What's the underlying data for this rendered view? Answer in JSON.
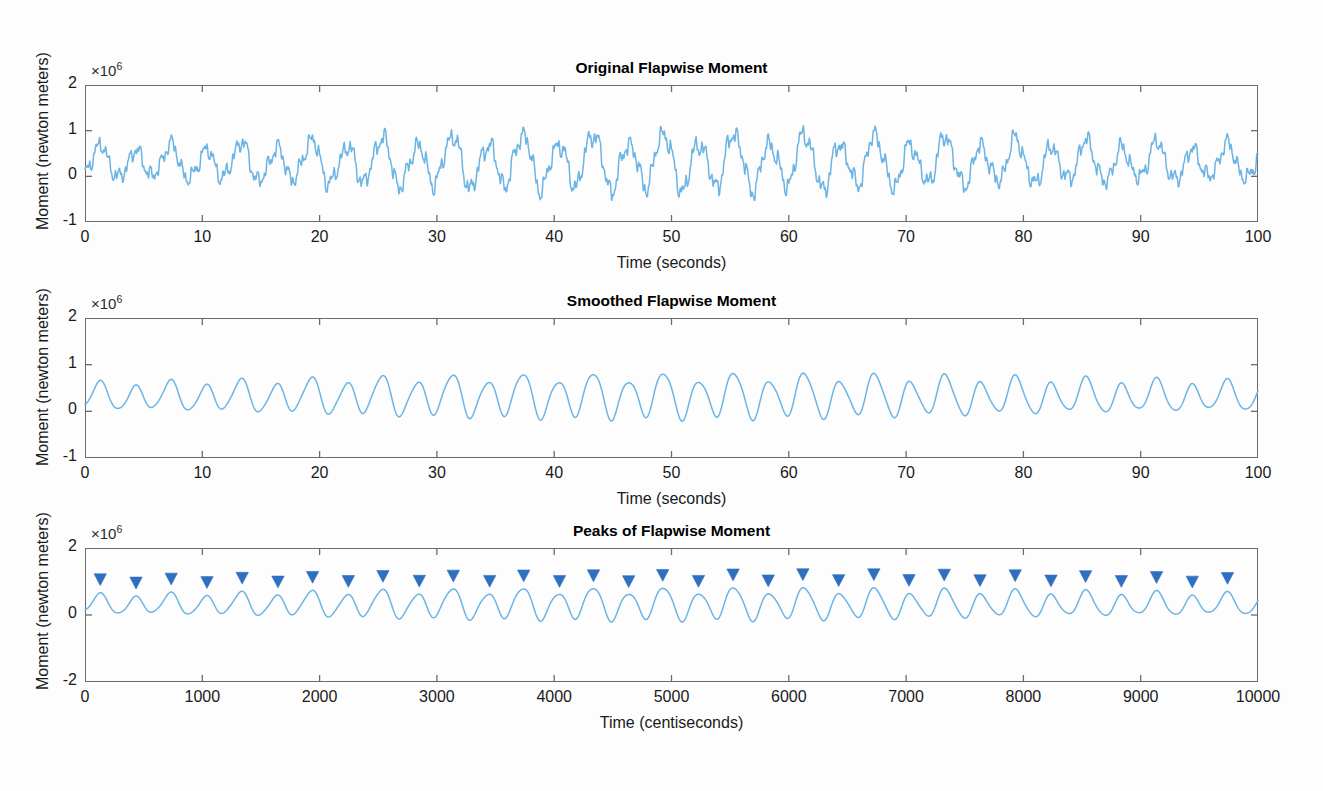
{
  "figure": {
    "background_color": "#fdfdfd",
    "axis_color": "#6b6b6b",
    "line_color": "#6cb4e4",
    "marker_color": "#2f6fc0",
    "width": 1323,
    "height": 791
  },
  "chart_data": [
    {
      "type": "line",
      "title": "Original Flapwise Moment",
      "xlabel": "Time (seconds)",
      "ylabel": "Moment (newton meters)",
      "exponent_label": "×10",
      "exponent_value": "6",
      "xlim": [
        0,
        100
      ],
      "ylim": [
        -1000000,
        2000000
      ],
      "xticks": [
        0,
        10,
        20,
        30,
        40,
        50,
        60,
        70,
        80,
        90,
        100
      ],
      "xticklabels": [
        "0",
        "10",
        "20",
        "30",
        "40",
        "50",
        "60",
        "70",
        "80",
        "90",
        "100"
      ],
      "yticks": [
        -1000000,
        0,
        1000000,
        2000000
      ],
      "yticklabels": [
        "-1",
        "0",
        "1",
        "2"
      ],
      "grid": false,
      "legend": "none",
      "series_name": "original flapwise moment",
      "description": "Noisy oscillating rotor blade flapwise bending moment, base frequency about 0.33 Hz with high frequency noise, mean near 3e5 N·m, peaks rising from about 6e5 early to about 1.2e6 near t=53 s, minima dipping to about -4e5 near t=59 s",
      "signal_model": {
        "mean": 300000,
        "base_amplitude": 260000,
        "base_frequency_hz": 0.333,
        "amplitude_envelope_peak_time_s": 50,
        "amplitude_envelope_gain": 2.1,
        "noise_amplitude": 150000,
        "noise_frequencies_hz": [
          1.1,
          2.3,
          3.7,
          5.9
        ],
        "samples": 2000
      }
    },
    {
      "type": "line",
      "title": "Smoothed Flapwise Moment",
      "xlabel": "Time (seconds)",
      "ylabel": "Moment (newton meters)",
      "exponent_label": "×10",
      "exponent_value": "6",
      "xlim": [
        0,
        100
      ],
      "ylim": [
        -1000000,
        2000000
      ],
      "xticks": [
        0,
        10,
        20,
        30,
        40,
        50,
        60,
        70,
        80,
        90,
        100
      ],
      "xticklabels": [
        "0",
        "10",
        "20",
        "30",
        "40",
        "50",
        "60",
        "70",
        "80",
        "90",
        "100"
      ],
      "yticks": [
        -1000000,
        0,
        1000000,
        2000000
      ],
      "yticklabels": [
        "-1",
        "0",
        "1",
        "2"
      ],
      "grid": false,
      "legend": "none",
      "series_name": "smoothed flapwise moment",
      "description": "Low-pass filtered version of the original signal, clean sinusoid at about 0.33 Hz oscillating between roughly 1e5 and 6e5 early, growing to between 0 and 9e5 around t=45-55 s",
      "signal_model": {
        "mean": 320000,
        "base_amplitude": 230000,
        "base_frequency_hz": 0.333,
        "amplitude_envelope_peak_time_s": 50,
        "amplitude_envelope_gain": 1.9,
        "noise_amplitude": 0,
        "samples": 2000
      }
    },
    {
      "type": "line",
      "title": "Peaks of Flapwise Moment",
      "xlabel": "Time (centiseconds)",
      "ylabel": "Moment (newton meters)",
      "exponent_label": "×10",
      "exponent_value": "6",
      "xlim": [
        0,
        10000
      ],
      "ylim": [
        -2000000,
        2000000
      ],
      "xticks": [
        0,
        1000,
        2000,
        3000,
        4000,
        5000,
        6000,
        7000,
        8000,
        9000,
        10000
      ],
      "xticklabels": [
        "0",
        "1000",
        "2000",
        "3000",
        "4000",
        "5000",
        "6000",
        "7000",
        "8000",
        "9000",
        "10000"
      ],
      "yticks": [
        -2000000,
        0,
        2000000
      ],
      "yticklabels": [
        "-2",
        "0",
        "2"
      ],
      "grid": false,
      "legend": "none",
      "series_name": "smoothed flapwise moment with detected peaks",
      "marker_shape": "filled-down-triangle",
      "marker_count": 33,
      "description": "Same smoothed signal plotted against centiseconds with detected local maxima annotated by filled downward triangles placed just above each peak",
      "signal_model": {
        "mean": 320000,
        "base_amplitude": 230000,
        "base_frequency_hz": 0.333,
        "amplitude_envelope_peak_time_s": 50,
        "amplitude_envelope_gain": 1.9,
        "noise_amplitude": 0,
        "samples": 2000
      }
    }
  ]
}
